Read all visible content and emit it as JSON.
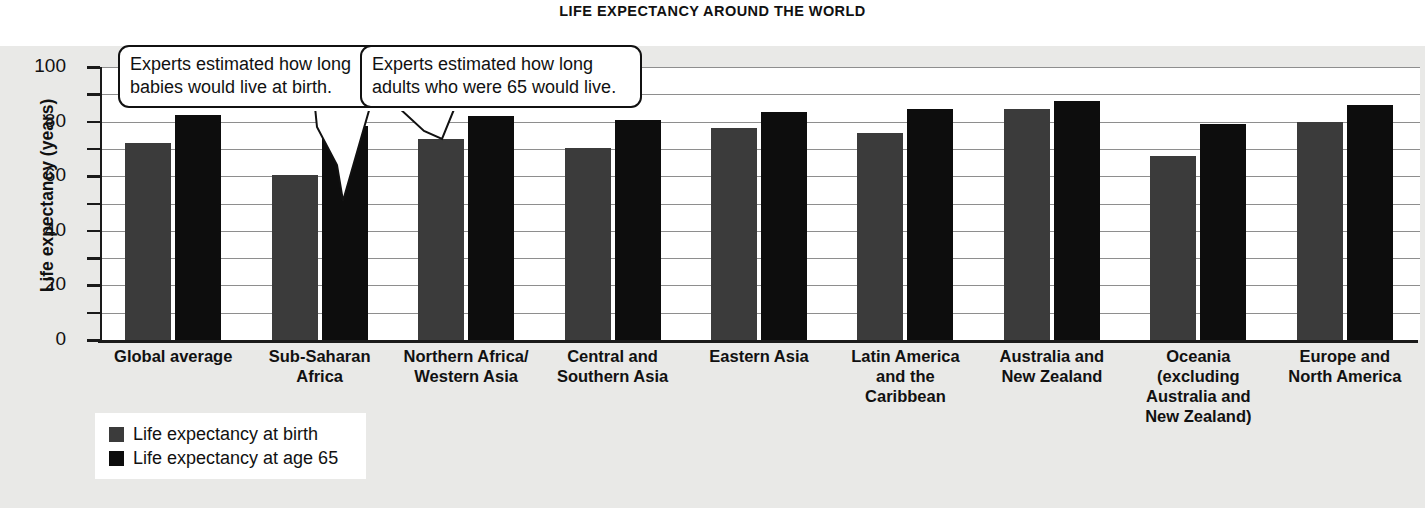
{
  "chart_data": {
    "type": "bar",
    "title": "LIFE EXPECTANCY AROUND THE WORLD",
    "xlabel": "",
    "ylabel": "Life expectancy (years)",
    "ylim": [
      0,
      100
    ],
    "yticks_major": [
      0,
      20,
      40,
      60,
      80,
      100
    ],
    "yticks_minor": [
      10,
      30,
      50,
      70,
      90
    ],
    "grid": true,
    "legend_position": "bottom-left",
    "categories": [
      "Global average",
      "Sub-Saharan Africa",
      "Northern Africa/Western Asia",
      "Central and Southern Asia",
      "Eastern Asia",
      "Latin America and the Caribbean",
      "Australia and New Zealand",
      "Oceania (excluding Australia and New Zealand)",
      "Europe and North America"
    ],
    "category_lines": [
      [
        "Global average"
      ],
      [
        "Sub-Saharan",
        "Africa"
      ],
      [
        "Northern Africa/",
        "Western Asia"
      ],
      [
        "Central and",
        "Southern Asia"
      ],
      [
        "Eastern Asia"
      ],
      [
        "Latin America",
        "and the",
        "Caribbean"
      ],
      [
        "Australia and",
        "New Zealand"
      ],
      [
        "Oceania",
        "(excluding",
        "Australia and",
        "New Zealand)"
      ],
      [
        "Europe and",
        "North America"
      ]
    ],
    "series": [
      {
        "name": "Life expectancy at birth",
        "color": "#3b3b3b",
        "values": [
          72,
          60.5,
          73.5,
          70.5,
          77.5,
          76,
          84.5,
          67.5,
          80
        ]
      },
      {
        "name": "Life expectancy at age 65",
        "color": "#0d0d0d",
        "values": [
          82.5,
          78.5,
          82,
          80.5,
          83.5,
          84.5,
          87.5,
          79,
          86
        ]
      }
    ],
    "annotations": [
      {
        "id": "callout-birth",
        "text": "Experts estimated how long babies would live at birth.",
        "lines": [
          "Experts estimated how long",
          "babies would live at birth."
        ],
        "points_to": "Sub-Saharan Africa — life expectancy at birth bar"
      },
      {
        "id": "callout-age65",
        "text": "Experts estimated how long adults who were 65 would live.",
        "lines": [
          "Experts estimated how long",
          "adults who were 65 would live."
        ],
        "points_to": "Sub-Saharan Africa — life expectancy at age 65 bar"
      }
    ]
  },
  "colors": {
    "panel_background": "#e9e9e7",
    "plot_background": "#ffffff",
    "axis": "#1a1a1a",
    "gridline": "#8e8e8e",
    "series_birth": "#3b3b3b",
    "series_age65": "#0d0d0d"
  }
}
